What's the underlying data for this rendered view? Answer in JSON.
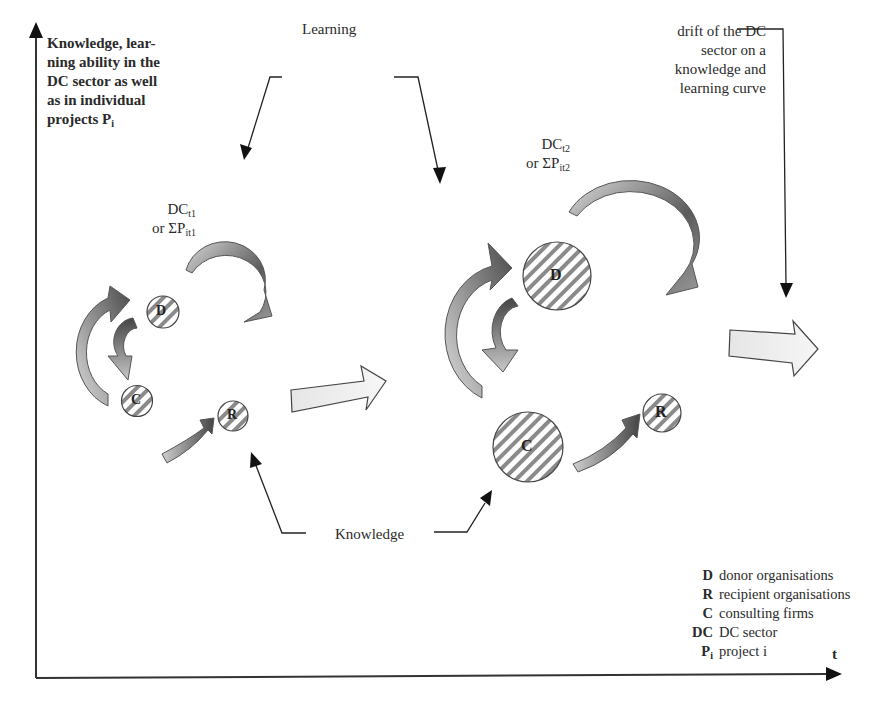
{
  "diagram": {
    "y_axis_label": {
      "lines": [
        "Knowledge, lear-",
        "ning ability in the",
        "DC sector as well",
        "as in individual"
      ],
      "last_line_prefix": "projects P",
      "last_line_sub": "i"
    },
    "x_axis_label": "t",
    "top_right_note": [
      "drift of the DC",
      "sector on a",
      "knowledge and",
      "learning curve"
    ],
    "learning_label": "Learning",
    "knowledge_label": "Knowledge",
    "state_t1": {
      "line1_prefix": "DC",
      "line1_sub": "t1",
      "line2_prefix": "or ΣP",
      "line2_sub": "it1",
      "nodes": [
        "D",
        "C",
        "R"
      ]
    },
    "state_t2": {
      "line1_prefix": "DC",
      "line1_sub": "t2",
      "line2_prefix": "or ΣP",
      "line2_sub": "it2",
      "nodes": [
        "D",
        "C",
        "R"
      ]
    },
    "legend": [
      {
        "key": "D",
        "value": "donor organisations"
      },
      {
        "key": "R",
        "value": "recipient organisations"
      },
      {
        "key": "C",
        "value": "consulting firms"
      },
      {
        "key": "DC",
        "value": "DC sector"
      },
      {
        "key": "P",
        "key_sub": "i",
        "value": "project i"
      }
    ],
    "colors": {
      "axis": "#333333",
      "arrow_dark": "#555555",
      "arrow_light": "#d8d8d8",
      "hatch": "#777777"
    }
  }
}
